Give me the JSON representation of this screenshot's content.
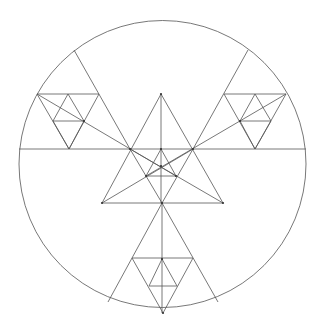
{
  "diagram": {
    "title": "",
    "colors": {
      "background": "#ffffff",
      "stroke": "#555555",
      "point": "#333333"
    },
    "circle": {
      "cx": 162.5,
      "cy": 164,
      "r": 143.5
    },
    "lines": [
      [
        19,
        149,
        306,
        149
      ],
      [
        161,
        94,
        102,
        203
      ],
      [
        161,
        94,
        223,
        203
      ],
      [
        102,
        203,
        223,
        203
      ],
      [
        161,
        94,
        161,
        203
      ],
      [
        162,
        203,
        162,
        313
      ],
      [
        74,
        50,
        130,
        149
      ],
      [
        130,
        149,
        162,
        203
      ],
      [
        248,
        50,
        193,
        149
      ],
      [
        193,
        149,
        162,
        203
      ],
      [
        37,
        94,
        176,
        176
      ],
      [
        286,
        94,
        146,
        176
      ],
      [
        161,
        149,
        146,
        176
      ],
      [
        161,
        149,
        176,
        176
      ],
      [
        146,
        176,
        176,
        176
      ],
      [
        130,
        149,
        223,
        203
      ],
      [
        193,
        149,
        102,
        203
      ],
      [
        37,
        94,
        99,
        94
      ],
      [
        37,
        94,
        69,
        149
      ],
      [
        99,
        94,
        69,
        149
      ],
      [
        68,
        94,
        53,
        121
      ],
      [
        68,
        94,
        84,
        121
      ],
      [
        53,
        121,
        84,
        121
      ],
      [
        53,
        121,
        69,
        149
      ],
      [
        84,
        121,
        69,
        149
      ],
      [
        224,
        94,
        286,
        94
      ],
      [
        224,
        94,
        255,
        149
      ],
      [
        286,
        94,
        255,
        149
      ],
      [
        255,
        94,
        240,
        121
      ],
      [
        255,
        94,
        271,
        121
      ],
      [
        240,
        121,
        271,
        121
      ],
      [
        240,
        121,
        255,
        149
      ],
      [
        271,
        121,
        255,
        149
      ],
      [
        162,
        203,
        108,
        302
      ],
      [
        162,
        203,
        218,
        302
      ],
      [
        132,
        258,
        193,
        258
      ],
      [
        132,
        258,
        163,
        313
      ],
      [
        193,
        258,
        163,
        313
      ],
      [
        162,
        259,
        149,
        286
      ],
      [
        162,
        259,
        177,
        286
      ],
      [
        149,
        286,
        177,
        286
      ]
    ],
    "points": [
      [
        161,
        94
      ],
      [
        130,
        149
      ],
      [
        193,
        149
      ],
      [
        161,
        149
      ],
      [
        161,
        166
      ],
      [
        146,
        176
      ],
      [
        176,
        176
      ],
      [
        102,
        203
      ],
      [
        162,
        203
      ],
      [
        223,
        203
      ],
      [
        162,
        259
      ],
      [
        163,
        313
      ],
      [
        84,
        121
      ],
      [
        240,
        121
      ]
    ]
  }
}
